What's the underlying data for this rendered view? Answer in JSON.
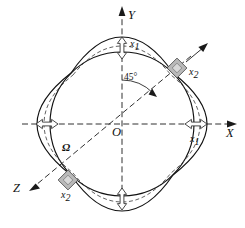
{
  "figure": {
    "type": "vibrating-ring-gyroscope-mode-diagram",
    "background_color": "#ffffff",
    "line_color": "#111111",
    "block_color": "#b9b9b9"
  },
  "axes": {
    "y": {
      "label": "Y",
      "direction": "up"
    },
    "x": {
      "label": "X",
      "direction": "right"
    },
    "z": {
      "label": "Z",
      "direction": "lower-left-diagonal"
    },
    "origin": {
      "label": "O"
    }
  },
  "annotations": {
    "angle": {
      "label": "45°",
      "between": "Y-axis and secondary-mode axis"
    },
    "omega": {
      "label": "Ω",
      "meaning": "input angular rate"
    }
  },
  "amplitudes": {
    "primary_top": {
      "label": "x",
      "subscript": "1"
    },
    "primary_right": {
      "label": "x",
      "subscript": "1"
    },
    "secondary_upper_right": {
      "label": "x",
      "subscript": "2"
    },
    "secondary_lower_left": {
      "label": "x",
      "subscript": "2"
    }
  },
  "shapes": {
    "undeformed_ring": "circle",
    "primary_mode": "solid four-lobe elliptical deformation",
    "secondary_mode": "dashed four-lobe elliptical deformation"
  },
  "markers": {
    "node_blocks": [
      {
        "name": "block-upper-right",
        "position": "45-degree"
      },
      {
        "name": "block-lower-left",
        "position": "225-degree"
      }
    ]
  }
}
